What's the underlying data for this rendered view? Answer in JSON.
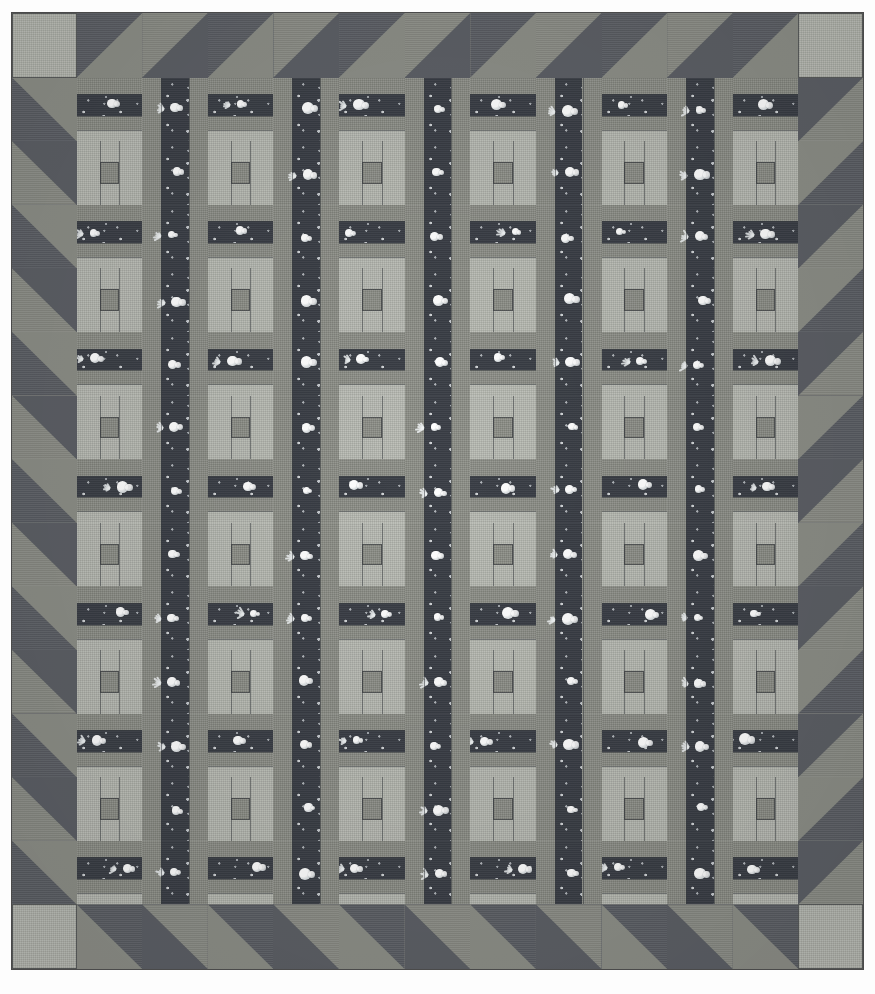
{
  "artwork": {
    "kind": "quilt-photograph",
    "title": "Rail Fence / Chinese Coins sampler quilt",
    "orientation": "portrait",
    "background_color": "#fdfdfd"
  },
  "canvas": {
    "width": 875,
    "height": 994
  },
  "quilt": {
    "left": 12,
    "top": 13,
    "width": 851,
    "height": 956,
    "outline_color": "#4a4a4a"
  },
  "palette": {
    "light": "#b9bcb4",
    "medium": "#8d8f88",
    "dark": "#5d6066",
    "print": "#3b3f47",
    "motif": "#f2f5f6",
    "seam": "#3c3f43"
  },
  "border": {
    "name": "sawtooth-half-square-triangle-border",
    "unit": 64.6,
    "thickness": 64.6,
    "corner_patch": "plain-light-square",
    "top": {
      "corner_left": "light",
      "corner_right": "light",
      "units": 11,
      "triangle_colors": [
        "dark",
        "medium"
      ],
      "diagonal": "bottom-left-to-top-right"
    },
    "bottom": {
      "corner_left": "light",
      "corner_right": "light",
      "units": 11,
      "triangle_colors": [
        "dark",
        "medium"
      ],
      "diagonal": "top-left-to-bottom-right"
    },
    "left": {
      "units": 13,
      "triangle_colors": [
        "dark",
        "medium"
      ],
      "diagonal": "top-left-to-bottom-right"
    },
    "right": {
      "units": 13,
      "triangle_colors": [
        "dark",
        "medium"
      ],
      "diagonal": "bottom-left-to-top-right"
    }
  },
  "grid": {
    "columns": 11,
    "rows": 13,
    "cell_width": 65.0,
    "cell_height": 63.5,
    "inner_left": 64.6,
    "inner_top": 64.6,
    "layout": "checkerboard-alternating",
    "block_types": [
      "coin-strip",
      "rail-fence"
    ]
  },
  "blocks": {
    "coin_strip": {
      "label": "Coin strip block",
      "description": "Horizontal bands: medium rail, dark novelty print centre band, medium rail, light rail",
      "bands": [
        {
          "fabric": "medium",
          "height_pct": 26
        },
        {
          "fabric": "print",
          "height_pct": 34
        },
        {
          "fabric": "medium",
          "height_pct": 22
        },
        {
          "fabric": "light",
          "height_pct": 18
        }
      ]
    },
    "rail_fence": {
      "label": "Rail fence block",
      "description": "Vertical light rails flanking a medium centre rail that is split by two seams",
      "rails": [
        {
          "fabric": "light",
          "width_pct": 30
        },
        {
          "fabric": "light",
          "width_pct": 22
        },
        {
          "fabric": "medium",
          "width_pct": 22
        },
        {
          "fabric": "light",
          "width_pct": 26
        }
      ],
      "centre_splits": 2
    },
    "print_column": {
      "label": "Print sashing column",
      "description": "Narrow dark novelty-print vertical sashing between rail blocks"
    }
  },
  "motifs": {
    "blossom_label": "white blossom",
    "sprig_label": "white sprig",
    "count_visible": 48
  }
}
